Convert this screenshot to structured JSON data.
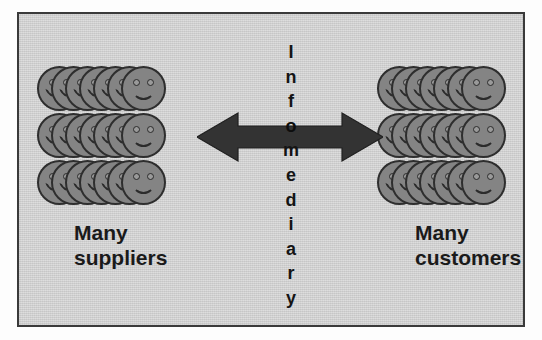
{
  "figure": {
    "background_color": "#d2d2d2",
    "border_color": "#3a3a3a",
    "page_color": "#ffffff"
  },
  "center": {
    "word": "Infomediary",
    "letters": [
      "I",
      "n",
      "f",
      "o",
      "m",
      "e",
      "d",
      "i",
      "a",
      "r",
      "y"
    ],
    "orientation": "vertical",
    "letter_on_arrow_index": 3,
    "color": "#141414"
  },
  "arrow": {
    "name": "double-headed-arrow",
    "direction": "bidirectional-horizontal",
    "color": "#333333",
    "outline_color": "#1e1e1e"
  },
  "groups": [
    {
      "id": "suppliers",
      "label": "Many\nsuppliers",
      "label_line1": "Many",
      "label_line2": "suppliers",
      "side": "left",
      "rows": 3,
      "faces_per_row": 7,
      "face_color": "#848484",
      "face_outline": "#2e2e2e",
      "icon": "smiley-face-icon"
    },
    {
      "id": "customers",
      "label": "Many\ncustomers",
      "label_line1": "Many",
      "label_line2": "customers",
      "side": "right",
      "rows": 3,
      "faces_per_row": 7,
      "face_color": "#848484",
      "face_outline": "#2e2e2e",
      "icon": "smiley-face-icon"
    }
  ]
}
